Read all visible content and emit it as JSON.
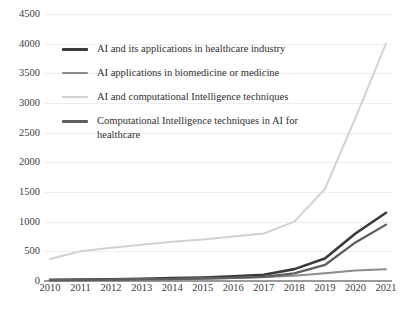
{
  "chart_data": {
    "type": "line",
    "title": "",
    "subtitle": "",
    "xlabel": "",
    "ylabel": "",
    "grid": true,
    "legend_position": "inside-top-left",
    "categories": [
      "2010",
      "2011",
      "2012",
      "2013",
      "2014",
      "2015",
      "2016",
      "2017",
      "2018",
      "2019",
      "2020",
      "2021"
    ],
    "x": [
      2010,
      2011,
      2012,
      2013,
      2014,
      2015,
      2016,
      2017,
      2018,
      2019,
      2020,
      2021
    ],
    "xlim": [
      2010,
      2021
    ],
    "ylim": [
      0,
      4500
    ],
    "ytick_labels": [
      "0",
      "500",
      "1000",
      "1500",
      "2000",
      "2500",
      "3000",
      "3500",
      "4000",
      "4500"
    ],
    "ytick_values": [
      0,
      500,
      1000,
      1500,
      2000,
      2500,
      3000,
      3500,
      4000,
      4500
    ],
    "series": [
      {
        "name": "AI and its applications in healthcare industry",
        "color": "#3a3a3a",
        "width": 2.6,
        "values": [
          20,
          25,
          30,
          38,
          48,
          60,
          78,
          105,
          200,
          380,
          800,
          1150
        ]
      },
      {
        "name": "AI applications in biomedicine or medicine",
        "color": "#8c8c8c",
        "width": 2.0,
        "values": [
          15,
          18,
          22,
          28,
          34,
          42,
          52,
          68,
          90,
          130,
          175,
          200
        ]
      },
      {
        "name": "AI and computational Intelligence techniques",
        "color": "#d2d2d2",
        "width": 2.0,
        "values": [
          370,
          500,
          560,
          610,
          660,
          700,
          750,
          800,
          1000,
          1550,
          2750,
          4000
        ]
      },
      {
        "name": "Computational Intelligence techniques in AI for healthcare",
        "color": "#5e5e5e",
        "width": 2.3,
        "values": [
          12,
          16,
          20,
          26,
          32,
          40,
          52,
          70,
          130,
          270,
          650,
          950
        ]
      }
    ]
  },
  "legend": {
    "items": [
      {
        "label": "AI and its applications in healthcare industry",
        "color": "#3a3a3a",
        "thickness": 3.2
      },
      {
        "label": "AI applications in biomedicine or medicine",
        "color": "#8c8c8c",
        "thickness": 2.0
      },
      {
        "label": "AI and computational Intelligence techniques",
        "color": "#d2d2d2",
        "thickness": 2.0
      },
      {
        "label": "Computational Intelligence techniques in AI for healthcare",
        "color": "#5e5e5e",
        "thickness": 2.8
      }
    ]
  },
  "colors": {
    "background": "#ffffff",
    "gridline": "#eeeeee",
    "axis": "#9a9a9a",
    "tick_text": "#3d3d3d",
    "legend_text": "#2f2f2f"
  }
}
